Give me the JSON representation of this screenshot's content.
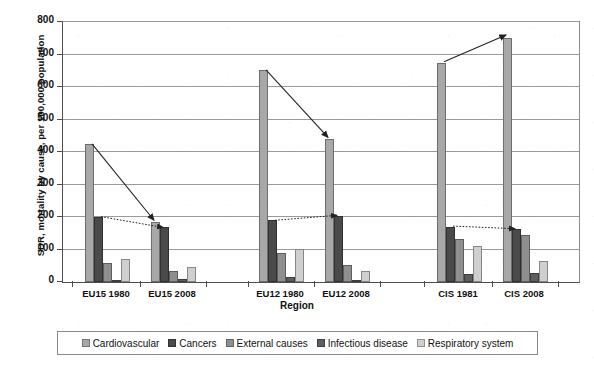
{
  "chart_data": {
    "type": "bar",
    "title": "",
    "xlabel": "Region",
    "ylabel": "SDR, mortality by cause, per 100,000 population",
    "ylim": [
      0,
      800
    ],
    "ytick_values": [
      0,
      100,
      200,
      300,
      400,
      500,
      600,
      700,
      800
    ],
    "ytick_labels": [
      "0",
      "100",
      "200",
      "300",
      "400",
      "500",
      "600",
      "700",
      "800"
    ],
    "grid": true,
    "legend_position": "bottom",
    "categories": [
      "EU15 1980",
      "EU15 2008",
      "EU12 1980",
      "EU12 2008",
      "CIS 1981",
      "CIS 2008"
    ],
    "series": [
      {
        "name": "Cardiovascular",
        "color": "#a8a8a8",
        "values": [
          425,
          185,
          653,
          440,
          675,
          750
        ]
      },
      {
        "name": "Cancers",
        "color": "#4a4a4a",
        "values": [
          201,
          168,
          190,
          203,
          170,
          162
        ]
      },
      {
        "name": "External causes",
        "color": "#8f8f8f",
        "values": [
          60,
          35,
          90,
          52,
          133,
          145
        ]
      },
      {
        "name": "Infectious disease",
        "color": "#5e5e5e",
        "values": [
          7,
          10,
          15,
          6,
          25,
          28
        ]
      },
      {
        "name": "Respiratory system",
        "color": "#cfcfcf",
        "values": [
          72,
          45,
          103,
          34,
          110,
          65
        ]
      }
    ],
    "annotations": [
      {
        "label": "cardiovascular-trend-eu15",
        "style": "solid",
        "from_category": "EU15 1980",
        "from_value": 425,
        "to_category": "EU15 2008",
        "to_value": 190
      },
      {
        "label": "cancers-trend-eu15",
        "style": "dotted",
        "from_category": "EU15 1980",
        "from_value": 201,
        "to_category": "EU15 2008",
        "to_value": 168
      },
      {
        "label": "cardiovascular-trend-eu12",
        "style": "solid",
        "from_category": "EU12 1980",
        "from_value": 653,
        "to_category": "EU12 2008",
        "to_value": 445
      },
      {
        "label": "cancers-trend-eu12",
        "style": "dotted",
        "from_category": "EU12 1980",
        "from_value": 190,
        "to_category": "EU12 2008",
        "to_value": 205
      },
      {
        "label": "cardiovascular-trend-cis",
        "style": "solid",
        "from_category": "CIS 1981",
        "from_value": 678,
        "to_category": "CIS 2008",
        "to_value": 760
      },
      {
        "label": "cancers-trend-cis",
        "style": "dotted",
        "from_category": "CIS 1981",
        "from_value": 172,
        "to_category": "CIS 2008",
        "to_value": 164
      }
    ]
  },
  "axis": {
    "y_title": "SDR, mortality by cause, per 100,000 population",
    "x_title": "Region"
  },
  "legend": {
    "items": [
      {
        "label": "Cardiovascular",
        "color": "#a8a8a8"
      },
      {
        "label": "Cancers",
        "color": "#4a4a4a"
      },
      {
        "label": "External causes",
        "color": "#8f8f8f"
      },
      {
        "label": "Infectious disease",
        "color": "#5e5e5e"
      },
      {
        "label": "Respiratory system",
        "color": "#cfcfcf"
      }
    ]
  }
}
